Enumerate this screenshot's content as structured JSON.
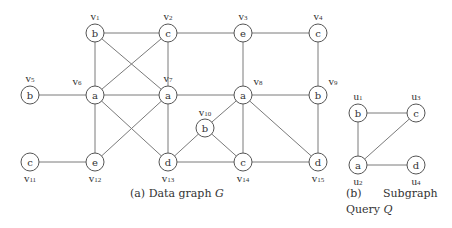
{
  "data_graph": {
    "caption": "(a) Data graph",
    "caption_var": "G",
    "nodes": [
      {
        "id": "v1",
        "sub": "1",
        "label": "b",
        "name_pos": "above"
      },
      {
        "id": "v2",
        "sub": "2",
        "label": "c",
        "name_pos": "above"
      },
      {
        "id": "v3",
        "sub": "3",
        "label": "e",
        "name_pos": "above"
      },
      {
        "id": "v4",
        "sub": "4",
        "label": "c",
        "name_pos": "above"
      },
      {
        "id": "v5",
        "sub": "5",
        "label": "b",
        "name_pos": "above"
      },
      {
        "id": "v6",
        "sub": "6",
        "label": "a",
        "name_pos": "above-left"
      },
      {
        "id": "v7",
        "sub": "7",
        "label": "a",
        "name_pos": "above"
      },
      {
        "id": "v8",
        "sub": "8",
        "label": "a",
        "name_pos": "above-right"
      },
      {
        "id": "v9",
        "sub": "9",
        "label": "b",
        "name_pos": "above-right"
      },
      {
        "id": "v10",
        "sub": "10",
        "label": "b",
        "name_pos": "above"
      },
      {
        "id": "v11",
        "sub": "11",
        "label": "c",
        "name_pos": "below"
      },
      {
        "id": "v12",
        "sub": "12",
        "label": "e",
        "name_pos": "below"
      },
      {
        "id": "v13",
        "sub": "13",
        "label": "d",
        "name_pos": "below"
      },
      {
        "id": "v14",
        "sub": "14",
        "label": "c",
        "name_pos": "below"
      },
      {
        "id": "v15",
        "sub": "15",
        "label": "d",
        "name_pos": "below"
      }
    ],
    "edges": [
      [
        "v1",
        "v2"
      ],
      [
        "v2",
        "v3"
      ],
      [
        "v3",
        "v4"
      ],
      [
        "v1",
        "v6"
      ],
      [
        "v1",
        "v7"
      ],
      [
        "v2",
        "v6"
      ],
      [
        "v2",
        "v7"
      ],
      [
        "v3",
        "v8"
      ],
      [
        "v4",
        "v9"
      ],
      [
        "v5",
        "v6"
      ],
      [
        "v6",
        "v7"
      ],
      [
        "v7",
        "v8"
      ],
      [
        "v8",
        "v9"
      ],
      [
        "v6",
        "v12"
      ],
      [
        "v6",
        "v13"
      ],
      [
        "v7",
        "v12"
      ],
      [
        "v7",
        "v13"
      ],
      [
        "v8",
        "v10"
      ],
      [
        "v8",
        "v14"
      ],
      [
        "v8",
        "v15"
      ],
      [
        "v9",
        "v15"
      ],
      [
        "v10",
        "v13"
      ],
      [
        "v10",
        "v14"
      ],
      [
        "v11",
        "v12"
      ],
      [
        "v13",
        "v14"
      ],
      [
        "v14",
        "v15"
      ]
    ]
  },
  "query_graph": {
    "caption_line1_a": "(b)",
    "caption_line1_b": "Subgraph",
    "caption_line2": "Query",
    "caption_var": "Q",
    "nodes": [
      {
        "id": "u1",
        "sub": "1",
        "label": "b",
        "name_pos": "above"
      },
      {
        "id": "u2",
        "sub": "2",
        "label": "a",
        "name_pos": "below"
      },
      {
        "id": "u3",
        "sub": "3",
        "label": "c",
        "name_pos": "above"
      },
      {
        "id": "u4",
        "sub": "4",
        "label": "d",
        "name_pos": "below"
      }
    ],
    "edges": [
      [
        "u1",
        "u3"
      ],
      [
        "u1",
        "u2"
      ],
      [
        "u2",
        "u3"
      ],
      [
        "u2",
        "u4"
      ]
    ]
  }
}
